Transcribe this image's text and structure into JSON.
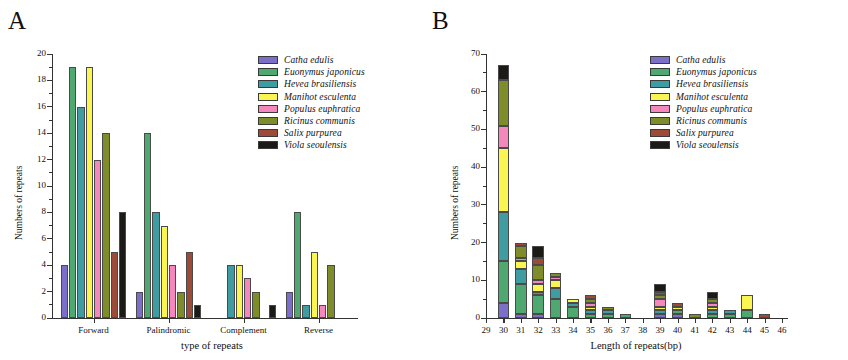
{
  "figure": {
    "panels": [
      {
        "letter": "A",
        "chart_index": 0
      },
      {
        "letter": "B",
        "chart_index": 1
      }
    ]
  },
  "species": [
    {
      "name": "Catha edulis",
      "color": "#7b6fc9"
    },
    {
      "name": "Euonymus japonicus",
      "color": "#4fa870"
    },
    {
      "name": "Hevea brasiliensis",
      "color": "#3f9ca0"
    },
    {
      "name": "Manihot esculenta",
      "color": "#fbf552"
    },
    {
      "name": "Populus euphratica",
      "color": "#f488bd"
    },
    {
      "name": "Ricinus communis",
      "color": "#7f8c2a"
    },
    {
      "name": "Salix purpurea",
      "color": "#9c4b39"
    },
    {
      "name": "Viola seoulensis",
      "color": "#1c1a16"
    }
  ],
  "chart_data": [
    {
      "type": "bar",
      "title": "A",
      "xlabel": "type of repeats",
      "ylabel": "Numbers of repeats",
      "ylim": [
        0,
        20
      ],
      "yticks": [
        0,
        2,
        4,
        6,
        8,
        10,
        12,
        14,
        16,
        18,
        20
      ],
      "grid": false,
      "legend_position": "top-right",
      "categories": [
        "Forward",
        "Palindromic",
        "Complement",
        "Reverse"
      ],
      "series": [
        {
          "name": "Catha edulis",
          "color": "#7b6fc9",
          "values": [
            4,
            2,
            0,
            2
          ]
        },
        {
          "name": "Euonymus japonicus",
          "color": "#4fa870",
          "values": [
            19,
            14,
            0,
            8
          ]
        },
        {
          "name": "Hevea brasiliensis",
          "color": "#3f9ca0",
          "values": [
            16,
            8,
            4,
            1
          ]
        },
        {
          "name": "Manihot esculenta",
          "color": "#fbf552",
          "values": [
            19,
            7,
            4,
            5
          ]
        },
        {
          "name": "Populus euphratica",
          "color": "#f488bd",
          "values": [
            12,
            4,
            3,
            1
          ]
        },
        {
          "name": "Ricinus communis",
          "color": "#7f8c2a",
          "values": [
            14,
            2,
            2,
            4
          ]
        },
        {
          "name": "Salix purpurea",
          "color": "#9c4b39",
          "values": [
            5,
            5,
            0,
            0
          ]
        },
        {
          "name": "Viola seoulensis",
          "color": "#1c1a16",
          "values": [
            8,
            1,
            1,
            0
          ]
        }
      ]
    },
    {
      "type": "bar",
      "stacked": true,
      "title": "B",
      "xlabel": "Length of repeats(bp)",
      "ylabel": "Numbers of repeats",
      "ylim": [
        0,
        70
      ],
      "yticks": [
        0,
        10,
        20,
        30,
        40,
        50,
        60,
        70
      ],
      "grid": false,
      "legend_position": "top-right",
      "categories": [
        29,
        30,
        31,
        32,
        33,
        34,
        35,
        36,
        37,
        38,
        39,
        40,
        41,
        42,
        43,
        44,
        45,
        46
      ],
      "series": [
        {
          "name": "Catha edulis",
          "color": "#7b6fc9",
          "values": [
            0,
            4,
            1,
            1,
            0,
            0,
            0,
            0,
            0,
            0,
            1,
            1,
            0,
            0,
            0,
            0,
            0,
            0
          ]
        },
        {
          "name": "Euonymus japonicus",
          "color": "#4fa870",
          "values": [
            0,
            11,
            8,
            5,
            5,
            3,
            1,
            1,
            1,
            0,
            0,
            1,
            0,
            1,
            1,
            2,
            0,
            0
          ]
        },
        {
          "name": "Hevea brasiliensis",
          "color": "#3f9ca0",
          "values": [
            0,
            13,
            4,
            1,
            3,
            1,
            1,
            1,
            0,
            0,
            1,
            0,
            0,
            1,
            1,
            0,
            0,
            0
          ]
        },
        {
          "name": "Manihot esculenta",
          "color": "#fbf552",
          "values": [
            0,
            17,
            2,
            2,
            2,
            1,
            1,
            0,
            0,
            0,
            1,
            1,
            0,
            1,
            0,
            4,
            0,
            0
          ]
        },
        {
          "name": "Populus euphratica",
          "color": "#f488bd",
          "values": [
            0,
            6,
            1,
            1,
            1,
            0,
            1,
            0,
            0,
            0,
            2,
            0,
            0,
            1,
            0,
            0,
            0,
            0
          ]
        },
        {
          "name": "Ricinus communis",
          "color": "#7f8c2a",
          "values": [
            0,
            12,
            3,
            4,
            1,
            0,
            1,
            1,
            0,
            0,
            1,
            0,
            1,
            1,
            0,
            0,
            0,
            0
          ]
        },
        {
          "name": "Salix purpurea",
          "color": "#9c4b39",
          "values": [
            0,
            0,
            1,
            2,
            0,
            0,
            1,
            0,
            0,
            0,
            1,
            1,
            0,
            0,
            0,
            0,
            1,
            0
          ]
        },
        {
          "name": "Viola seoulensis",
          "color": "#1c1a16",
          "values": [
            0,
            4,
            0,
            3,
            0,
            0,
            0,
            0,
            0,
            0,
            2,
            0,
            0,
            2,
            0,
            0,
            0,
            0
          ]
        }
      ]
    }
  ]
}
